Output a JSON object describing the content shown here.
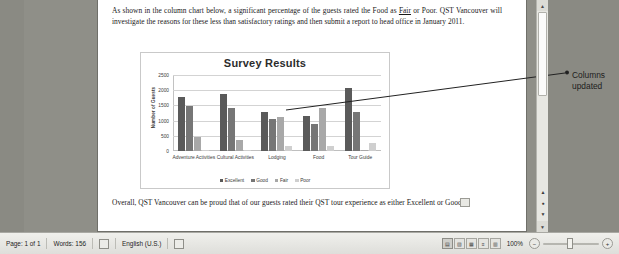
{
  "app": {
    "document_background": "#8a8a83",
    "page_background": "#ffffff"
  },
  "document": {
    "paragraph_top": "As shown in the column chart below, a significant percentage of the guests rated the Food as Fair or Poor.  QST Vancouver will investigate the reasons for these less than satisfactory ratings and then submit a report to head office in January 2011.",
    "paragraph_top_underlined_word": "Fair",
    "paragraph_bottom": "Overall, QST Vancouver can be proud that of our guests rated their QST tour experience as either Excellent or Good."
  },
  "annotation": {
    "line1": "Columns",
    "line2": "updated"
  },
  "chart_data": {
    "type": "bar",
    "title": "Survey Results",
    "xlabel": "",
    "ylabel": "Number of Guests",
    "ylim": [
      0,
      2500
    ],
    "yticks": [
      0,
      500,
      1000,
      1500,
      2000,
      2500
    ],
    "ytick_labels": [
      "0",
      "500",
      "1000",
      "1500",
      "2000",
      "2500"
    ],
    "grid": true,
    "legend_position": "bottom",
    "categories": [
      "Adventure Activities",
      "Cultural Activities",
      "Lodging",
      "Food",
      "Tour Guide"
    ],
    "series": [
      {
        "name": "Excellent",
        "color": "#5a5a5a",
        "values": [
          1770,
          1890,
          1280,
          1150,
          2070
        ]
      },
      {
        "name": "Good",
        "color": "#767676",
        "values": [
          1480,
          1430,
          1050,
          880,
          1280
        ]
      },
      {
        "name": "Fair",
        "color": "#a8a8a8",
        "values": [
          450,
          360,
          1110,
          1400,
          10
        ]
      },
      {
        "name": "Poor",
        "color": "#cfcfcf",
        "values": [
          40,
          30,
          170,
          170,
          270
        ]
      }
    ]
  },
  "statusbar": {
    "page": "Page: 1 of 1",
    "words": "Words: 156",
    "language": "English (U.S.)",
    "zoom": "100%",
    "proofing_icon": "proofing-errors-icon",
    "track_changes_icon": "track-changes-icon"
  },
  "scrollbar": {
    "up_arrow": "▲",
    "down_arrow": "▼",
    "prev_page": "▲",
    "select_object": "●",
    "next_page": "▼"
  },
  "viewbuttons": [
    {
      "name": "print-layout-view",
      "glyph": "▤",
      "active": true
    },
    {
      "name": "full-screen-reading-view",
      "glyph": "▧",
      "active": false
    },
    {
      "name": "web-layout-view",
      "glyph": "▦",
      "active": false
    },
    {
      "name": "outline-view",
      "glyph": "≡",
      "active": false
    },
    {
      "name": "draft-view",
      "glyph": "▥",
      "active": false
    }
  ]
}
